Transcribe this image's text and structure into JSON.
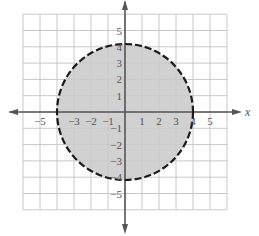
{
  "chart_data": {
    "type": "region",
    "title": "",
    "xlabel": "x",
    "ylabel": "",
    "xlim": [
      -6,
      6
    ],
    "ylim": [
      -6,
      6
    ],
    "grid": true,
    "x_ticks": [
      "-5",
      "-3",
      "-2",
      "-1",
      "1",
      "2",
      "3",
      "4",
      "5"
    ],
    "y_ticks": [
      "5",
      "4",
      "3",
      "2",
      "1",
      "-1",
      "-2",
      "-3",
      "-4",
      "-5"
    ],
    "shape": {
      "kind": "circle",
      "center": [
        0,
        0
      ],
      "radius": 4,
      "boundary": "dashed",
      "fill": "inside",
      "inequality": "x^2 + y^2 < 16"
    },
    "colors": {
      "grid": "#c8c8c8",
      "axis": "#555555",
      "fill": "#c9c9c9",
      "boundary": "#1a1a1a"
    }
  }
}
